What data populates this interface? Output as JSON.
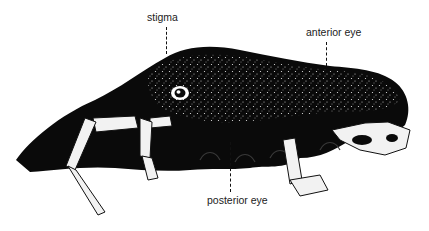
{
  "figure": {
    "colors": {
      "body": "#0a0a0a",
      "speckle": "#ffffff",
      "legs": "#f2f2f2",
      "label_text": "#222222",
      "background": "#ffffff"
    }
  },
  "labels": [
    {
      "id": "stigma",
      "text": "stigma"
    },
    {
      "id": "anterior-eye",
      "text": "anterior eye"
    },
    {
      "id": "posterior-eye",
      "text": "posterior eye"
    }
  ]
}
